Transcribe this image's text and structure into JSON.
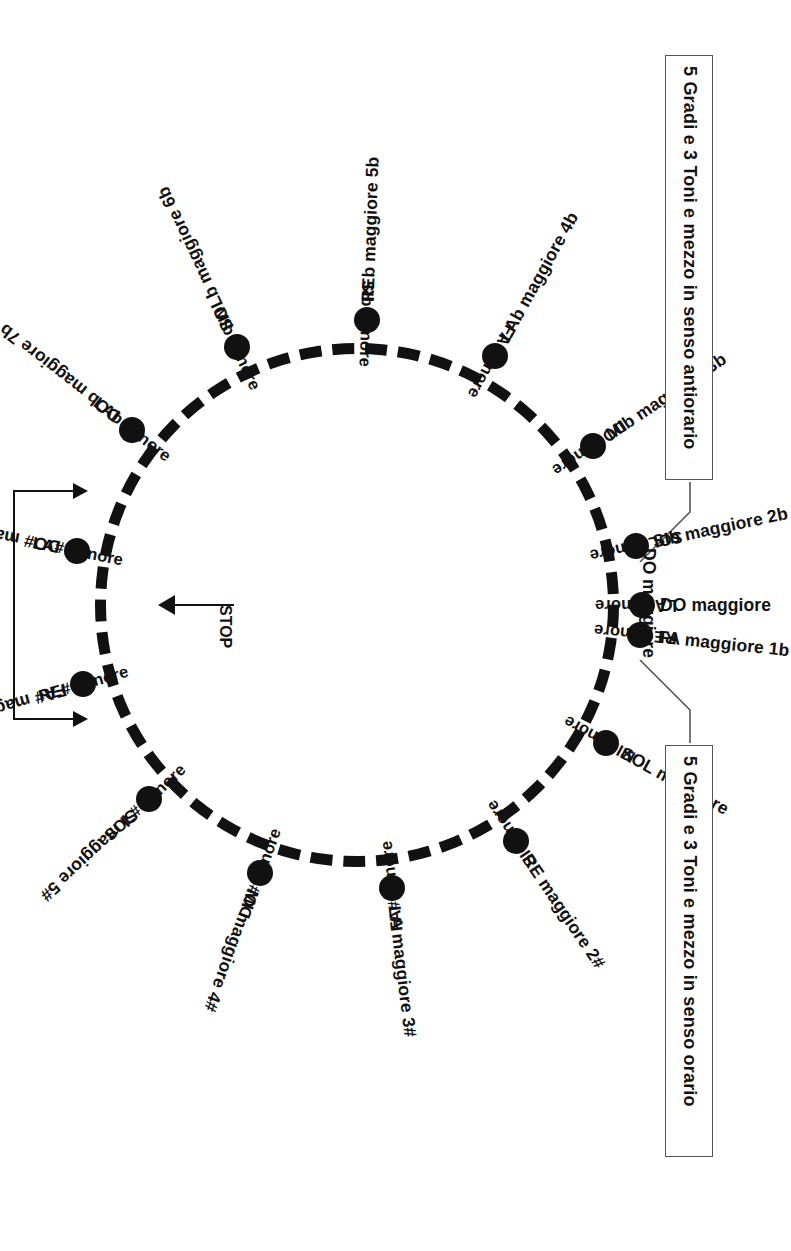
{
  "diagram": {
    "center_label": "DO maggiore",
    "stop_label": "STOP",
    "accent_color": "#111111",
    "box_border_color": "#555555"
  },
  "notes": {
    "counterclockwise": "5 Gradi e 3 Toni e mezzo in senso antiorario",
    "clockwise": "5 Gradi e 3 Toni e mezzo in senso orario"
  },
  "chart_data": {
    "type": "pie",
    "legend_position": "right",
    "grid": false,
    "categories": [
      "DO",
      "SOL",
      "RE",
      "LA",
      "MI",
      "SI",
      "FA#/SOLb",
      "DO#/REb",
      "LAb",
      "MIb",
      "SIb",
      "FA"
    ],
    "outer_ring_label": "maggiore",
    "inner_ring_label": "minore",
    "entries": [
      {
        "angle_deg": 0,
        "major": "DO maggiore",
        "minor": "LA minore",
        "accidentals": 0,
        "type": "natural"
      },
      {
        "angle_deg": 30,
        "major": "SOL maggiore",
        "minor": "MI minore",
        "accidentals": 1,
        "type": "sharp"
      },
      {
        "angle_deg": 60,
        "major": "RE maggiore 2#",
        "minor": "SI minore",
        "accidentals": 2,
        "type": "sharp"
      },
      {
        "angle_deg": 90,
        "major": "LA maggiore 3#",
        "minor": "FA# minore",
        "accidentals": 3,
        "type": "sharp"
      },
      {
        "angle_deg": 120,
        "major": "MI maggiore 4#",
        "minor": "DO# minore",
        "accidentals": 4,
        "type": "sharp"
      },
      {
        "angle_deg": 150,
        "major": "SI maggiore 5#",
        "minor": "SOL# minore",
        "accidentals": 5,
        "type": "sharp"
      },
      {
        "angle_deg": 180,
        "major": "FA# maggiore 6#",
        "minor": "RE# minore",
        "accidentals": 6,
        "type": "sharp"
      },
      {
        "angle_deg": 210,
        "major": "DO# maggiore 7#",
        "minor": "LA# minore",
        "accidentals": 7,
        "type": "sharp"
      },
      {
        "angle_deg": 230,
        "major": "DOb maggiore 7b",
        "minor": "LAb minore",
        "accidentals": 7,
        "type": "flat"
      },
      {
        "angle_deg": 255,
        "major": "SOLb maggiore 6b",
        "minor": "MIb minore",
        "accidentals": 6,
        "type": "flat"
      },
      {
        "angle_deg": 280,
        "major": "REb maggiore 5b",
        "minor": "SIb minore",
        "accidentals": 5,
        "type": "flat"
      },
      {
        "angle_deg": 305,
        "major": "LAb maggiore 4b",
        "minor": "FA minore",
        "accidentals": 4,
        "type": "flat"
      },
      {
        "angle_deg": 330,
        "major": "MIb maggiore 3b",
        "minor": "DO minore",
        "accidentals": 3,
        "type": "flat"
      },
      {
        "angle_deg": 350,
        "major": "SIb maggiore 2b",
        "minor": "SOL minore",
        "accidentals": 2,
        "type": "flat"
      },
      {
        "angle_deg": 368,
        "major": "FA maggiore 1b",
        "minor": "RE minore",
        "accidentals": 1,
        "type": "flat"
      }
    ]
  },
  "nodes": {
    "majors": [
      {
        "id": "do",
        "label": "DO maggiore",
        "angle": 0
      },
      {
        "id": "sol",
        "label": "SOL maggiore",
        "angle": 29
      },
      {
        "id": "re",
        "label": "RE maggiore 2#",
        "angle": 56
      },
      {
        "id": "la",
        "label": "LA maggiore 3#",
        "angle": 83
      },
      {
        "id": "mi",
        "label": "MI maggiore 4#",
        "angle": 110
      },
      {
        "id": "si",
        "label": "SI maggiore 5#",
        "angle": 137
      },
      {
        "id": "fad",
        "label": "FA# maggiore 6#",
        "angle": 164
      },
      {
        "id": "dod",
        "label": "DO# maggiore 7#",
        "angle": 191
      },
      {
        "id": "dob",
        "label": "DOb maggiore 7b",
        "angle": 218
      },
      {
        "id": "solb",
        "label": "SOLb maggiore 6b",
        "angle": 245
      },
      {
        "id": "reb",
        "label": "REb maggiore 5b",
        "angle": 272
      },
      {
        "id": "lab",
        "label": "LAb maggiore 4b",
        "angle": 299
      },
      {
        "id": "mib",
        "label": "MIb maggiore 3b",
        "angle": 326
      },
      {
        "id": "sib",
        "label": "SIb maggiore 2b",
        "angle": 348
      },
      {
        "id": "fa",
        "label": "FA maggiore 1b",
        "angle": 366
      }
    ],
    "minors": [
      {
        "id": "la-m",
        "label": "LA minore",
        "angle": 0
      },
      {
        "id": "mi-m",
        "label": "MI minore",
        "angle": 29
      },
      {
        "id": "si-m",
        "label": "SI minore",
        "angle": 56
      },
      {
        "id": "fad-m",
        "label": "FA# minore",
        "angle": 83
      },
      {
        "id": "dod-m",
        "label": "DO# minore",
        "angle": 110
      },
      {
        "id": "sold-m",
        "label": "SOL# minore",
        "angle": 137
      },
      {
        "id": "red-m",
        "label": "RE# minore",
        "angle": 164
      },
      {
        "id": "lad-m",
        "label": "LA# minore",
        "angle": 191
      },
      {
        "id": "lab-m",
        "label": "LAb minore",
        "angle": 218
      },
      {
        "id": "mib-m",
        "label": "MIb minore",
        "angle": 245
      },
      {
        "id": "sib-m",
        "label": "SIb minore",
        "angle": 272
      },
      {
        "id": "fa-m",
        "label": "FA minore",
        "angle": 299
      },
      {
        "id": "do-m",
        "label": "DO minore",
        "angle": 326
      },
      {
        "id": "sol-m",
        "label": "SOL minore",
        "angle": 348
      },
      {
        "id": "re-m",
        "label": "RE minore",
        "angle": 366
      }
    ]
  }
}
